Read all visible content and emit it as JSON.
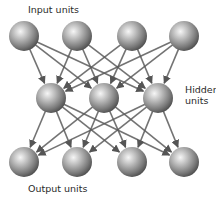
{
  "labels": {
    "input": "Input units",
    "hidden_line1": "Hidden",
    "hidden_line2": "units",
    "output": "Output units"
  },
  "colors": {
    "background": "#ffffff",
    "sphere_highlight": "#f4f4f4",
    "sphere_mid": "#a8a8a8",
    "sphere_shadow": "#4a4a4a",
    "connection": "#5a5a5a",
    "text": "#2a2a2a"
  },
  "layers": {
    "input": [
      {
        "id": "i1",
        "cx": 24,
        "cy": 36
      },
      {
        "id": "i2",
        "cx": 77,
        "cy": 36
      },
      {
        "id": "i3",
        "cx": 132,
        "cy": 36
      },
      {
        "id": "i4",
        "cx": 184,
        "cy": 36
      }
    ],
    "hidden": [
      {
        "id": "h1",
        "cx": 51,
        "cy": 98
      },
      {
        "id": "h2",
        "cx": 104,
        "cy": 98
      },
      {
        "id": "h3",
        "cx": 158,
        "cy": 98
      }
    ],
    "output": [
      {
        "id": "o1",
        "cx": 24,
        "cy": 162
      },
      {
        "id": "o2",
        "cx": 77,
        "cy": 162
      },
      {
        "id": "o3",
        "cx": 132,
        "cy": 162
      },
      {
        "id": "o4",
        "cx": 184,
        "cy": 162
      }
    ]
  },
  "sphere_radius": 15,
  "connections": "fully-connected input→hidden and hidden→output, directed arrows"
}
